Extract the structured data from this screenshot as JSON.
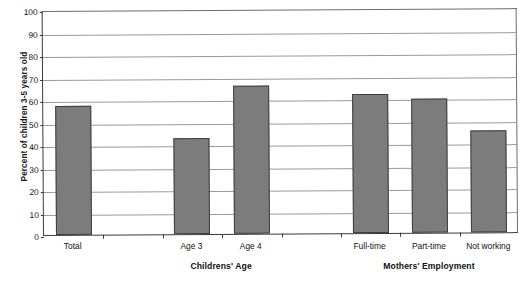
{
  "chart_data": {
    "type": "bar",
    "title": "",
    "xlabel": "",
    "ylabel": "Percent of children 3-5 years old",
    "ylim": [
      0,
      100
    ],
    "ytick_step": 10,
    "grid": true,
    "legend": "none",
    "bar_color": "#7c7c7c",
    "bar_border_color": "#3f3f3f",
    "gridline_color": "#9a9a9a",
    "axis_color": "#3a3a3a",
    "categories": [
      "Total",
      "",
      "Age 3",
      "Age 4",
      "",
      "Full-time",
      "Part-time",
      "Not working"
    ],
    "yticks": [
      "0",
      "10",
      "20",
      "30",
      "40",
      "50",
      "60",
      "70",
      "80",
      "90",
      "100"
    ],
    "bars": [
      {
        "label": "Total",
        "value": 57.2,
        "group": "overall"
      },
      {
        "label": "Age 3",
        "value": 42.5,
        "group": "childrens-age"
      },
      {
        "label": "Age 4",
        "value": 65.6,
        "group": "childrens-age"
      },
      {
        "label": "Full-time",
        "value": 61.7,
        "group": "mothers-employment"
      },
      {
        "label": "Part-time",
        "value": 59.4,
        "group": "mothers-employment"
      },
      {
        "label": "Not working",
        "value": 45.3,
        "group": "mothers-employment"
      }
    ],
    "groups": [
      {
        "name": "childrens-age",
        "label": "Childrens' Age"
      },
      {
        "name": "mothers-employment",
        "label": "Mothers' Employment"
      }
    ]
  }
}
